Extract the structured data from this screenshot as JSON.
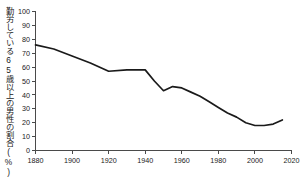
{
  "chart_data": {
    "type": "line",
    "title": "",
    "subtitle": "",
    "xlabel": "",
    "ylabel": "勤労している65歳以上の男性の割合(%)",
    "xlim": [
      1880,
      2020
    ],
    "ylim": [
      0,
      100
    ],
    "grid": false,
    "legend": null,
    "x_ticks": [
      "1880",
      "1900",
      "1920",
      "1940",
      "1960",
      "1980",
      "2000",
      "2020"
    ],
    "x_tick_values": [
      1880,
      1900,
      1920,
      1940,
      1960,
      1980,
      2000,
      2020
    ],
    "y_ticks": [
      "0",
      "10",
      "20",
      "30",
      "40",
      "50",
      "60",
      "70",
      "80",
      "90",
      "100"
    ],
    "y_tick_values": [
      0,
      10,
      20,
      30,
      40,
      50,
      60,
      70,
      80,
      90,
      100
    ],
    "series": [
      {
        "name": "勤労している65歳以上の男性の割合",
        "x": [
          1880,
          1890,
          1900,
          1910,
          1920,
          1930,
          1940,
          1945,
          1950,
          1955,
          1960,
          1965,
          1970,
          1975,
          1980,
          1985,
          1990,
          1995,
          2000,
          2005,
          2010,
          2015
        ],
        "values": [
          76,
          73,
          68,
          63,
          57,
          58,
          58,
          50,
          43,
          46,
          45,
          42,
          39,
          35,
          31,
          27,
          24,
          20,
          18,
          18,
          19,
          22
        ]
      }
    ],
    "annotations": []
  },
  "axis": {
    "y_axis_name": "y-axis",
    "x_axis_name": "x-axis"
  },
  "colors": {
    "line": "#1a1a1a",
    "axis": "#4a4a4a",
    "text": "#1a1a1a",
    "background": "#ffffff"
  }
}
